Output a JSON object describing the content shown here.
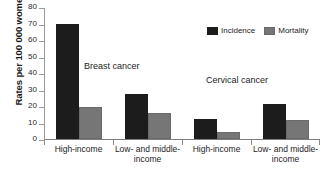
{
  "chart_data": {
    "type": "bar",
    "title": "",
    "xlabel": "",
    "ylabel": "Rates per 100 000 women",
    "ylim": [
      0,
      80
    ],
    "yticks": [
      0,
      10,
      20,
      30,
      40,
      50,
      60,
      70,
      80
    ],
    "grid": false,
    "legend_position": "top-right",
    "categories": [
      "High-income",
      "Low- and middle-income",
      "High-income",
      "Low- and middle-income"
    ],
    "category_lines": [
      [
        "High-income"
      ],
      [
        "Low- and middle-",
        "income"
      ],
      [
        "High-income"
      ],
      [
        "Low- and middle-",
        "income"
      ]
    ],
    "series": [
      {
        "name": "Incidence",
        "color": "#1c1c1c",
        "values": [
          70,
          27,
          12,
          21
        ]
      },
      {
        "name": "Mortality",
        "color": "#767676",
        "values": [
          19.5,
          16,
          4,
          11.5
        ]
      }
    ],
    "annotations": [
      {
        "text": "Breast cancer",
        "covers": [
          0,
          1
        ]
      },
      {
        "text": "Cervical cancer",
        "covers": [
          2,
          3
        ]
      }
    ]
  },
  "legend": {
    "items": [
      {
        "label": "Incidence"
      },
      {
        "label": "Mortality"
      }
    ]
  },
  "axis": {
    "y_title": "Rates per 100 000 women",
    "tick_labels": [
      "80",
      "70",
      "60",
      "50",
      "40",
      "30",
      "20",
      "10",
      "0"
    ]
  },
  "annotations": {
    "breast": "Breast cancer",
    "cervical": "Cervical cancer"
  },
  "title_strip": {
    "text": ""
  }
}
